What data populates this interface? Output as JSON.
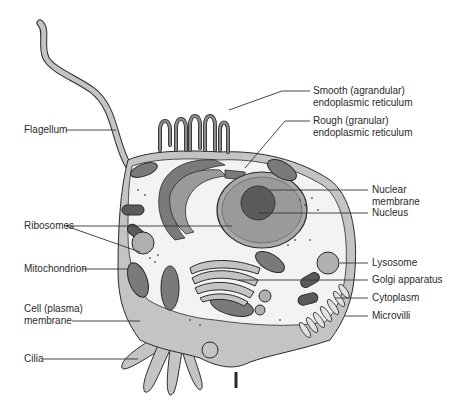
{
  "diagram": {
    "colors": {
      "background": "#ffffff",
      "cytoplasm": "#f3f3f1",
      "membrane_fill": "#c4c4c2",
      "organelle_dark": "#7a7a7a",
      "organelle_mid": "#a9a9a9",
      "nucleus": "#8e8e8e",
      "nucleolus": "#5a5a5a",
      "outline": "#2a2a2a",
      "leader_line": "#333333",
      "text": "#2a2a2a"
    },
    "labels_left": [
      {
        "id": "flagellum",
        "text": "Flagellum"
      },
      {
        "id": "ribosomes",
        "text": "Ribosomes"
      },
      {
        "id": "mitochondrion",
        "text": "Mitochondrion"
      },
      {
        "id": "cell-membrane",
        "text": "Cell (plasma)\nmembrane"
      },
      {
        "id": "cilia",
        "text": "Cilia"
      }
    ],
    "labels_right": [
      {
        "id": "smooth-er",
        "text": "Smooth (agrandular)\nendoplasmic reticulum"
      },
      {
        "id": "rough-er",
        "text": "Rough (granular)\nendoplasmic reticulum"
      },
      {
        "id": "nuclear-membrane",
        "text": "Nuclear\nmembrane"
      },
      {
        "id": "nucleus",
        "text": "Nucleus"
      },
      {
        "id": "lysosome",
        "text": "Lysosome"
      },
      {
        "id": "golgi",
        "text": "Golgi apparatus"
      },
      {
        "id": "cytoplasm",
        "text": "Cytoplasm"
      },
      {
        "id": "microvilli",
        "text": "Microvilli"
      }
    ]
  }
}
